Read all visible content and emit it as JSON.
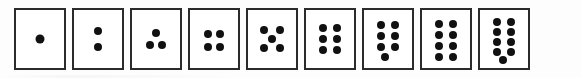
{
  "figure": {
    "kind": "dot-pattern-card-series",
    "card_count": 9,
    "background_color": "#fdfdfd",
    "card_fill_color": "#ffffff",
    "card_border_color": "#2b2b2b",
    "pip_color": "#111111",
    "card_width_px": 52,
    "card_height_px": 62,
    "pip_diameter_px": 8,
    "card_gap_px": 6
  },
  "cards": [
    {
      "name": "card-1",
      "dot_count": 1,
      "arrangement": "single-center",
      "pip_diameter_px": 9,
      "pips": [
        {
          "x": 50,
          "y": 50
        }
      ]
    },
    {
      "name": "card-2",
      "dot_count": 2,
      "arrangement": "vertical-pair-center",
      "pip_diameter_px": 8,
      "pips": [
        {
          "x": 50,
          "y": 37
        },
        {
          "x": 50,
          "y": 63
        }
      ]
    },
    {
      "name": "card-3",
      "dot_count": 3,
      "arrangement": "triangle-apex-up",
      "pip_diameter_px": 8,
      "pips": [
        {
          "x": 50,
          "y": 40
        },
        {
          "x": 37,
          "y": 60
        },
        {
          "x": 63,
          "y": 60
        }
      ]
    },
    {
      "name": "card-4",
      "dot_count": 4,
      "arrangement": "square-2x2",
      "pip_diameter_px": 8,
      "pips": [
        {
          "x": 38,
          "y": 42
        },
        {
          "x": 62,
          "y": 42
        },
        {
          "x": 38,
          "y": 63
        },
        {
          "x": 62,
          "y": 63
        }
      ]
    },
    {
      "name": "card-5",
      "dot_count": 5,
      "arrangement": "quincunx",
      "pip_diameter_px": 8,
      "pips": [
        {
          "x": 33,
          "y": 35
        },
        {
          "x": 67,
          "y": 35
        },
        {
          "x": 50,
          "y": 50
        },
        {
          "x": 33,
          "y": 66
        },
        {
          "x": 67,
          "y": 66
        }
      ]
    },
    {
      "name": "card-6",
      "dot_count": 6,
      "arrangement": "grid-3-rows-2-cols",
      "pip_diameter_px": 8,
      "pips": [
        {
          "x": 36,
          "y": 31
        },
        {
          "x": 64,
          "y": 31
        },
        {
          "x": 36,
          "y": 50
        },
        {
          "x": 64,
          "y": 50
        },
        {
          "x": 36,
          "y": 69
        },
        {
          "x": 64,
          "y": 69
        }
      ]
    },
    {
      "name": "card-7",
      "dot_count": 7,
      "arrangement": "grid-3-rows-2-cols-plus-bottom-center",
      "pip_diameter_px": 8,
      "pips": [
        {
          "x": 36,
          "y": 26
        },
        {
          "x": 64,
          "y": 26
        },
        {
          "x": 36,
          "y": 45
        },
        {
          "x": 64,
          "y": 45
        },
        {
          "x": 36,
          "y": 64
        },
        {
          "x": 64,
          "y": 64
        },
        {
          "x": 43,
          "y": 81
        }
      ]
    },
    {
      "name": "card-8",
      "dot_count": 8,
      "arrangement": "grid-4-rows-2-cols",
      "pip_diameter_px": 8,
      "pips": [
        {
          "x": 36,
          "y": 24
        },
        {
          "x": 64,
          "y": 24
        },
        {
          "x": 36,
          "y": 43
        },
        {
          "x": 64,
          "y": 43
        },
        {
          "x": 36,
          "y": 62
        },
        {
          "x": 64,
          "y": 62
        },
        {
          "x": 36,
          "y": 81
        },
        {
          "x": 64,
          "y": 81
        }
      ]
    },
    {
      "name": "card-9",
      "dot_count": 9,
      "arrangement": "grid-4-rows-2-cols-plus-bottom-center",
      "pip_diameter_px": 8,
      "pips": [
        {
          "x": 36,
          "y": 21
        },
        {
          "x": 64,
          "y": 21
        },
        {
          "x": 36,
          "y": 38
        },
        {
          "x": 64,
          "y": 38
        },
        {
          "x": 36,
          "y": 55
        },
        {
          "x": 64,
          "y": 55
        },
        {
          "x": 36,
          "y": 72
        },
        {
          "x": 64,
          "y": 72
        },
        {
          "x": 47,
          "y": 86
        }
      ]
    }
  ]
}
